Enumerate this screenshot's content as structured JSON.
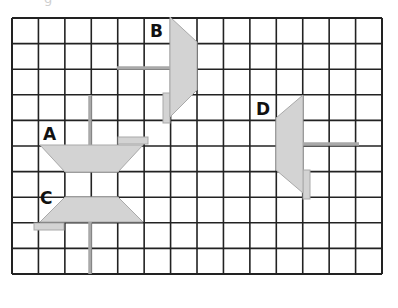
{
  "figure": {
    "clipped_title_fragment": "g",
    "grid": {
      "columns": 14,
      "rows": 10,
      "left": 12,
      "top": 18,
      "cell_width": 26.43,
      "cell_height": 25.6,
      "line_color": "#222222"
    },
    "shape_fill": "#d3d3d3",
    "shape_stroke": "#a9a9a9",
    "shapes": [
      {
        "label": "A",
        "label_pos": [
          43,
          142
        ],
        "polygon": "40,145 143,145 118,172 65,172",
        "rod": {
          "x1": 90,
          "y1": 95,
          "x2": 90,
          "y2": 145
        },
        "tab": {
          "x": 118,
          "y": 137,
          "w": 30,
          "h": 7
        }
      },
      {
        "label": "B",
        "label_pos": [
          150,
          39
        ],
        "polygon": "170,17 197,42 197,90 170,117",
        "rod": {
          "x1": 117,
          "y1": 68,
          "x2": 170,
          "y2": 68
        },
        "tab": {
          "x": 163,
          "y": 93,
          "w": 7,
          "h": 30
        }
      },
      {
        "label": "C",
        "label_pos": [
          40,
          206
        ],
        "polygon": "65,197 118,197 143,222 40,222",
        "rod": {
          "x1": 90,
          "y1": 222,
          "x2": 90,
          "y2": 274
        },
        "tab": {
          "x": 34,
          "y": 223,
          "w": 30,
          "h": 7
        }
      },
      {
        "label": "D",
        "label_pos": [
          256,
          117
        ],
        "polygon": "303,95 303,193 276,170 276,118",
        "rod": {
          "x1": 303,
          "y1": 144,
          "x2": 359,
          "y2": 144
        },
        "tab": {
          "x": 303,
          "y": 170,
          "w": 7,
          "h": 29
        }
      }
    ]
  }
}
